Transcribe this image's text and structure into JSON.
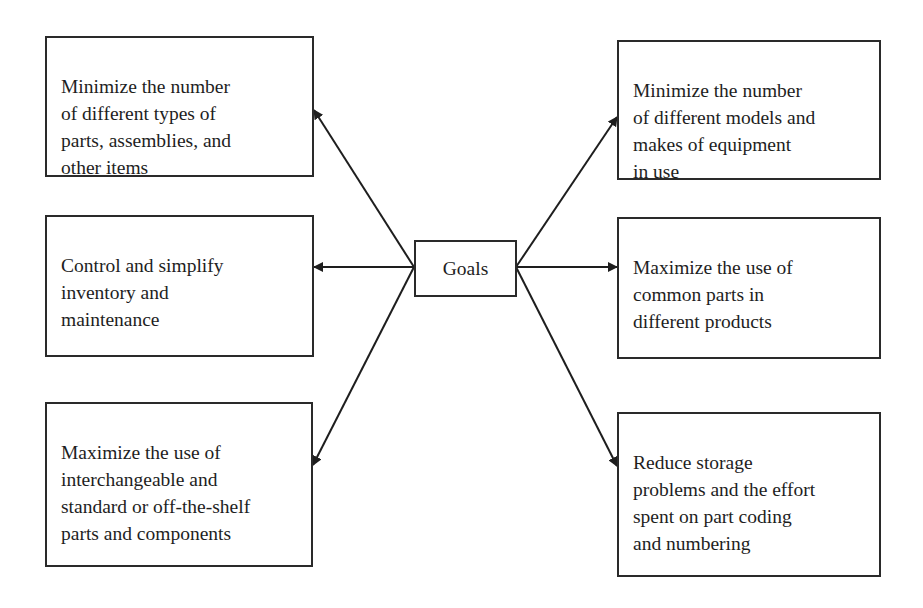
{
  "diagram": {
    "type": "hub-and-spoke",
    "center": {
      "label": "Goals"
    },
    "left_nodes": [
      {
        "id": "left-top",
        "text": "Minimize the number\nof different types of\nparts, assemblies, and\nother items"
      },
      {
        "id": "left-middle",
        "text": "Control and simplify\ninventory and\nmaintenance"
      },
      {
        "id": "left-bottom",
        "text": "Maximize the use of\ninterchangeable and\nstandard or off-the-shelf\nparts and components"
      }
    ],
    "right_nodes": [
      {
        "id": "right-top",
        "text": "Minimize the number\nof different models and\nmakes of equipment\nin use"
      },
      {
        "id": "right-middle",
        "text": "Maximize the use of\ncommon parts in\ndifferent products"
      },
      {
        "id": "right-bottom",
        "text": "Reduce storage\nproblems and the effort\nspent on part coding\nand numbering"
      }
    ],
    "edges": [
      {
        "from": "Goals",
        "to": "left-top",
        "arrow": "end"
      },
      {
        "from": "Goals",
        "to": "left-middle",
        "arrow": "end"
      },
      {
        "from": "Goals",
        "to": "left-bottom",
        "arrow": "end"
      },
      {
        "from": "Goals",
        "to": "right-top",
        "arrow": "end"
      },
      {
        "from": "Goals",
        "to": "right-middle",
        "arrow": "end"
      },
      {
        "from": "Goals",
        "to": "right-bottom",
        "arrow": "end"
      }
    ],
    "colors": {
      "line": "#1e1e1e",
      "border": "#2a2a2a",
      "background": "#ffffff"
    }
  }
}
